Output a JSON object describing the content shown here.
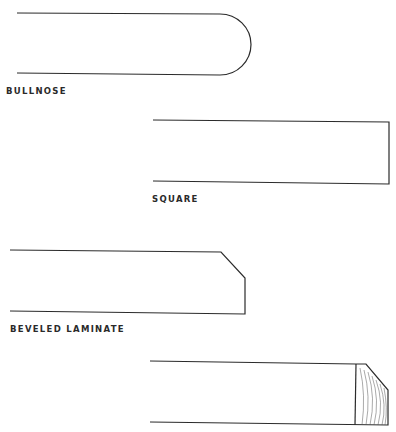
{
  "diagram": {
    "profiles": [
      {
        "id": "bullnose",
        "label": "BULLNOSE"
      },
      {
        "id": "square",
        "label": "SQUARE"
      },
      {
        "id": "beveled-laminate",
        "label": "BEVELED LAMINATE"
      },
      {
        "id": "beveled-wood-edge",
        "label": ""
      }
    ]
  },
  "colors": {
    "line": "#2b2b2b",
    "label": "#2a2a2a",
    "background": "#ffffff"
  }
}
